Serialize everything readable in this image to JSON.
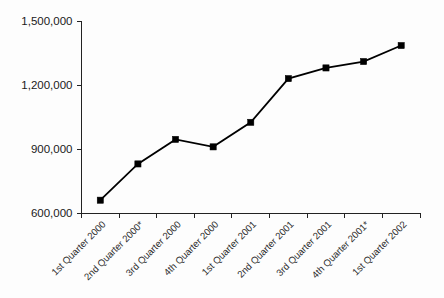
{
  "chart_data": {
    "type": "line",
    "title": "",
    "subtitle": "",
    "xlabel": "",
    "ylabel": "",
    "categories": [
      "1st Quarter 2000",
      "2nd Quarter 2000*",
      "3rd Quarter 2000",
      "4th Quarter 2000",
      "1st Quarter 2001",
      "2nd Quarter 2001",
      "3rd Quarter 2001",
      "4th Quarter 2001*",
      "1st Quarter 2002"
    ],
    "values": [
      660000,
      830000,
      945000,
      910000,
      1025000,
      1230000,
      1280000,
      1310000,
      1385000
    ],
    "series": [
      {
        "name": "",
        "values": [
          660000,
          830000,
          945000,
          910000,
          1025000,
          1230000,
          1280000,
          1310000,
          1385000
        ]
      }
    ],
    "ylim": [
      600000,
      1500000
    ],
    "ytick_labels": [
      "600,000",
      "900,000",
      "1,200,000",
      "1,500,000"
    ],
    "ytick_values": [
      600000,
      900000,
      1200000,
      1500000
    ],
    "grid": false,
    "legend": false,
    "legend_position": "none",
    "marker": "square",
    "line_color": "#000000",
    "marker_color": "#000000",
    "axis_color": "#222222",
    "background_color": "#fdfdfd",
    "xtick_rotation_degrees": 45,
    "annotations": [
      "* denotes quarter marked with asterisk"
    ]
  }
}
